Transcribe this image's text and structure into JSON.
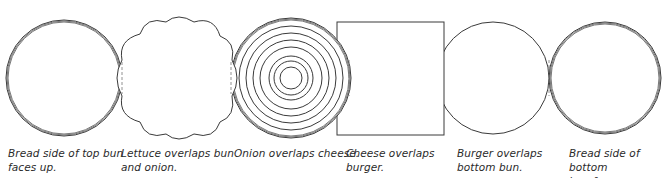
{
  "diagram": {
    "stroke_color": "#3a3a3a",
    "background": "#ffffff",
    "layers": [
      {
        "id": "top-bun",
        "shape": "circle-triple-stroke",
        "caption": "Bread side of top bun\nfaces up."
      },
      {
        "id": "lettuce",
        "shape": "scalloped-blob",
        "caption": "Lettuce overlaps bun\nand onion."
      },
      {
        "id": "onion",
        "shape": "concentric-rings",
        "caption": "Onion overlaps cheese."
      },
      {
        "id": "cheese",
        "shape": "square",
        "caption": "Cheese overlaps\nburger."
      },
      {
        "id": "burger",
        "shape": "circle",
        "caption": "Burger overlaps\nbottom bun."
      },
      {
        "id": "bottom-bun",
        "shape": "circle-triple-stroke",
        "caption": "Bread side of bottom\nbun faces up."
      }
    ]
  }
}
